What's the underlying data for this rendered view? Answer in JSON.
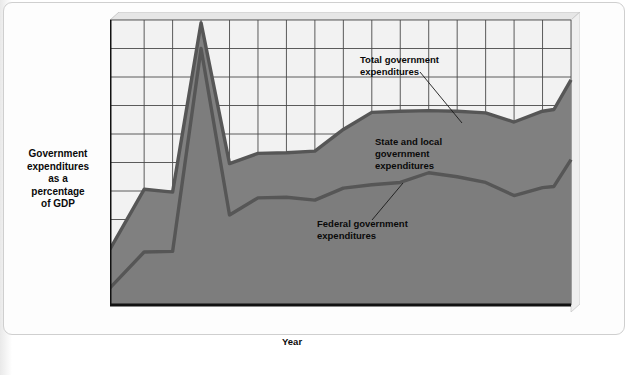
{
  "chart_data": {
    "type": "area",
    "title": "",
    "xlabel": "Year",
    "ylabel": "Government expenditures as a percentage of GDP",
    "ylabel_lines": [
      "Government",
      "expenditures",
      "as a",
      "percentage",
      "of GDP"
    ],
    "xlim": [
      1929,
      2010
    ],
    "ylim": [
      0,
      50
    ],
    "y_ticks": [
      0,
      5,
      10,
      15,
      20,
      25,
      30,
      35,
      40,
      45,
      50
    ],
    "x_ticks": [
      1929,
      1935,
      1940,
      1945,
      1950,
      1955,
      1960,
      1965,
      1970,
      1975,
      1980,
      1985,
      1990,
      1995,
      2000,
      2005,
      2010
    ],
    "grid": true,
    "legend_position": "inline-annotations",
    "x": [
      1929,
      1935,
      1940,
      1945,
      1950,
      1955,
      1960,
      1965,
      1970,
      1975,
      1980,
      1985,
      1990,
      1995,
      2000,
      2005,
      2007,
      2010
    ],
    "series": [
      {
        "name": "Total government expenditures",
        "values": [
          9.8,
          20.3,
          19.8,
          49.5,
          24.8,
          26.6,
          26.7,
          27.0,
          30.8,
          33.8,
          34.0,
          34.1,
          34.0,
          33.7,
          32.1,
          34.0,
          34.3,
          39.5
        ]
      },
      {
        "name": "Federal government expenditures",
        "values": [
          3.0,
          9.3,
          9.4,
          45.0,
          15.8,
          18.8,
          18.9,
          18.4,
          20.5,
          21.1,
          21.5,
          23.2,
          22.5,
          21.5,
          19.2,
          20.6,
          20.8,
          25.5
        ]
      }
    ],
    "annotations": [
      {
        "id": "total-government-expenditures",
        "lines": [
          "Total government",
          "expenditures"
        ],
        "text": "Total government expenditures"
      },
      {
        "id": "state-and-local-government-expenditures",
        "lines": [
          "State and local",
          "government",
          "expenditures"
        ],
        "text": "State and local government expenditures"
      },
      {
        "id": "federal-government-expenditures",
        "lines": [
          "Federal government",
          "expenditures"
        ],
        "text": "Federal government expenditures"
      }
    ],
    "colors": {
      "area_fill": "#808080",
      "series_line": "#565656",
      "plot_background": "#f2f2f2",
      "grid_line": "#4a4a4a",
      "axis": "#111111",
      "bevel_light": "#e2e2e2",
      "bevel_dark": "#b4b4b4",
      "text": "#0a0a0a"
    }
  }
}
